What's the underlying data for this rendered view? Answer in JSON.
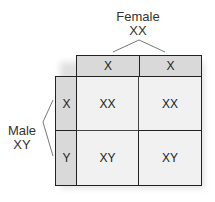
{
  "female": {
    "label": "Female",
    "genotype": "XX",
    "gametes": [
      "X",
      "X"
    ]
  },
  "male": {
    "label": "Male",
    "genotype": "XY",
    "gametes": [
      "X",
      "Y"
    ]
  },
  "grid": [
    [
      "XX",
      "XX"
    ],
    [
      "XY",
      "XY"
    ]
  ],
  "colors": {
    "header": "#d9d9d9",
    "cell": "#f1f1f1",
    "border": "#222222"
  }
}
